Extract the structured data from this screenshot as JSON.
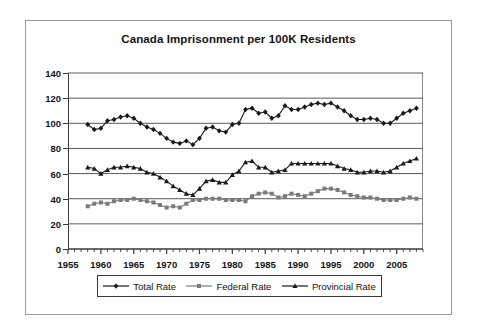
{
  "chart_data": {
    "type": "line",
    "title": "Canada Imprisonment per 100K Residents",
    "xlabel": "",
    "ylabel": "",
    "xlim": [
      1955,
      2009
    ],
    "ylim": [
      0,
      140
    ],
    "ytick_step": 20,
    "xtick_step": 5,
    "yticks": [
      0,
      20,
      40,
      60,
      80,
      100,
      120,
      140
    ],
    "xticks": [
      1955,
      1960,
      1965,
      1970,
      1975,
      1980,
      1985,
      1990,
      1995,
      2000,
      2005
    ],
    "grid": "horizontal",
    "legend_position": "bottom",
    "x": [
      1958,
      1959,
      1960,
      1961,
      1962,
      1963,
      1964,
      1965,
      1966,
      1967,
      1968,
      1969,
      1970,
      1971,
      1972,
      1973,
      1974,
      1975,
      1976,
      1977,
      1978,
      1979,
      1980,
      1981,
      1982,
      1983,
      1984,
      1985,
      1986,
      1987,
      1988,
      1989,
      1990,
      1991,
      1992,
      1993,
      1994,
      1995,
      1996,
      1997,
      1998,
      1999,
      2000,
      2001,
      2002,
      2003,
      2004,
      2005,
      2006,
      2007,
      2008
    ],
    "series": [
      {
        "name": "Total Rate",
        "marker": "diamond",
        "color": "#1a1a1a",
        "values": [
          99,
          95,
          96,
          102,
          103,
          105,
          106,
          104,
          100,
          97,
          95,
          92,
          88,
          85,
          84,
          86,
          83,
          88,
          96,
          97,
          94,
          93,
          99,
          100,
          111,
          112,
          108,
          109,
          104,
          106,
          114,
          111,
          111,
          113,
          115,
          116,
          115,
          116,
          113,
          110,
          106,
          103,
          103,
          104,
          103,
          100,
          100,
          104,
          108,
          110,
          112
        ]
      },
      {
        "name": "Federal Rate",
        "marker": "square",
        "color": "#7a7a7a",
        "values": [
          34,
          36,
          37,
          36,
          38,
          39,
          39,
          40,
          39,
          38,
          37,
          35,
          33,
          34,
          33,
          36,
          39,
          39,
          40,
          40,
          40,
          39,
          39,
          39,
          38,
          42,
          44,
          45,
          44,
          41,
          42,
          44,
          43,
          42,
          44,
          46,
          48,
          48,
          47,
          45,
          43,
          42,
          41,
          41,
          40,
          39,
          39,
          39,
          40,
          41,
          40
        ]
      },
      {
        "name": "Provincial Rate",
        "marker": "triangle",
        "color": "#1a1a1a",
        "values": [
          65,
          64,
          60,
          63,
          65,
          65,
          66,
          65,
          64,
          61,
          60,
          57,
          54,
          50,
          47,
          44,
          43,
          48,
          54,
          55,
          53,
          53,
          59,
          62,
          69,
          70,
          65,
          65,
          61,
          62,
          63,
          68,
          68,
          68,
          68,
          68,
          68,
          68,
          66,
          64,
          63,
          61,
          61,
          62,
          62,
          61,
          62,
          65,
          68,
          70,
          72
        ]
      }
    ]
  },
  "legend": {
    "items": [
      {
        "label": "Total Rate",
        "marker": "diamond"
      },
      {
        "label": "Federal Rate",
        "marker": "square"
      },
      {
        "label": "Provincial Rate",
        "marker": "triangle"
      }
    ]
  }
}
